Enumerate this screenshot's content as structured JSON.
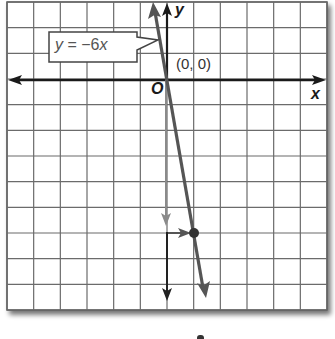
{
  "figure": {
    "type": "coordinate-graph",
    "equation_label": "y = −6x",
    "equation_parts": {
      "y": "y",
      "op": " = −6",
      "x": "x"
    },
    "axes": {
      "x_label": "x",
      "y_label": "y",
      "origin_label": "O",
      "x_range": [
        -6,
        6
      ],
      "y_range": [
        -9,
        3
      ],
      "grid": true,
      "grid_step": 1
    },
    "labeled_points": [
      {
        "label": "(0, 0)",
        "x": 0,
        "y": 0
      }
    ],
    "plotted_points": [
      {
        "x": 1,
        "y": -6,
        "note": "point reached by moving down 6 and right 1 from origin"
      }
    ],
    "line": {
      "slope": -6,
      "intercept": 0,
      "from": [
        -0.5,
        3
      ],
      "to": [
        1.45,
        -8.7
      ]
    },
    "guide_arrows": [
      {
        "direction": "down",
        "from": [
          0,
          0
        ],
        "to": [
          0,
          -6
        ],
        "color": "#8a8a8a"
      },
      {
        "direction": "right",
        "from": [
          0,
          -6
        ],
        "to": [
          1,
          -6
        ],
        "color": "#555555"
      },
      {
        "direction": "down",
        "from": [
          0,
          -6
        ],
        "to": [
          0,
          -8.6
        ],
        "color": "#222222"
      }
    ],
    "colors": {
      "grid": "#6b6b6b",
      "axis": "#1a1a1a",
      "line": "#555555",
      "guide_gray": "#8a8a8a",
      "point": "#333333",
      "callout_border": "#444444"
    }
  }
}
